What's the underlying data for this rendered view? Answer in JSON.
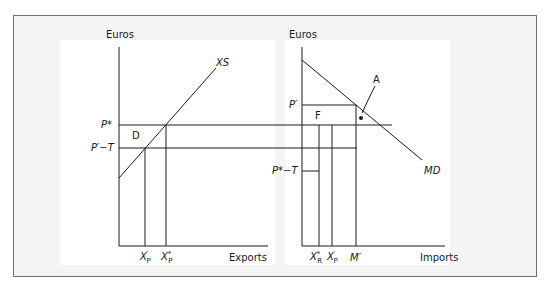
{
  "figure": {
    "left_chart": {
      "y_axis_label": "Euros",
      "x_axis_label": "Exports",
      "curve_label": "XS",
      "price_labels": {
        "p_star": "P*",
        "p_prime_minus_t": "P′−T"
      },
      "area_label": "D",
      "quantity_labels": {
        "x_prime_p": {
          "base": "X",
          "sup": "′",
          "sub": "P"
        },
        "x_star_p": {
          "base": "X",
          "sup": "*",
          "sub": "P"
        }
      }
    },
    "right_chart": {
      "y_axis_label": "Euros",
      "x_axis_label": "Imports",
      "curve_label": "MD",
      "price_labels": {
        "p_prime": "P′",
        "p_star_minus_t": "P*−T"
      },
      "area_labels": {
        "f": "F",
        "a": "A"
      },
      "quantity_labels": {
        "x_star_r": {
          "base": "X",
          "sup": "*",
          "sub": "R"
        },
        "x_prime_p": {
          "base": "X",
          "sup": "′",
          "sub": "P"
        },
        "m_prime": "M′"
      }
    },
    "colors": {
      "line": "#1a1a1a",
      "frame_border": "#6e6e6e",
      "frame_background": "#f4f4f4",
      "panel_background": "#ffffff"
    }
  }
}
